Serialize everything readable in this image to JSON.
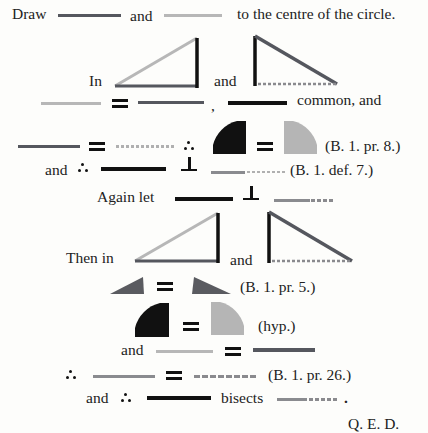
{
  "document": {
    "line1": {
      "prefix": "Draw",
      "mid": "and",
      "suffix": "to the centre of the circle."
    },
    "line2": {
      "prefix": "In",
      "mid": "and"
    },
    "line3": {
      "comma": ",",
      "suffix": "common, and"
    },
    "line4": {
      "ref": "(B. 1. pr. 8.)"
    },
    "line5": {
      "prefix": "and",
      "ref": "(B. 1. def. 7.)"
    },
    "line6": {
      "prefix": "Again let"
    },
    "line7": {
      "prefix": "Then in",
      "mid": "and"
    },
    "line8": {
      "ref": "(B. 1. pr. 5.)"
    },
    "line9": {
      "ref": "(hyp.)"
    },
    "line10": {
      "prefix": "and"
    },
    "line11": {
      "ref": "(B. 1. pr. 26.)"
    },
    "line12": {
      "prefix": "and",
      "mid": "bisects",
      "suffix": "."
    },
    "qed": "Q. E. D."
  },
  "colors": {
    "dark_line": "#55575e",
    "light_line": "#b7b7b7",
    "black_line": "#111111",
    "medium_line": "#8a8b8f",
    "light_shape": "#b5b5b5",
    "dark_shape": "#5a5b60"
  }
}
